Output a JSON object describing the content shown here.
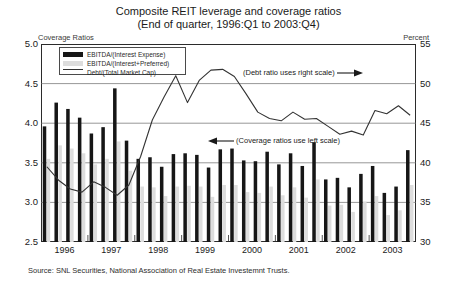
{
  "chart_data": {
    "type": "bar",
    "title": "Composite REIT leverage and coverage ratios",
    "subtitle": "(End of quarter, 1996:Q1 to 2003:Q4)",
    "left_axis_label": "Coverage Ratios",
    "right_axis_label": "Percent",
    "xlabel": "",
    "ylabel": "Coverage Ratios",
    "ylim": [
      2.5,
      5.0
    ],
    "y2lim": [
      30,
      55
    ],
    "yticks": [
      "2.5",
      "3.0",
      "3.5",
      "4.0",
      "4.5",
      "5.0"
    ],
    "y2ticks": [
      "30",
      "35",
      "40",
      "45",
      "50",
      "55"
    ],
    "grid": true,
    "legend_position": "top-left-inside",
    "categories": [
      "1996:Q1",
      "1996:Q2",
      "1996:Q3",
      "1996:Q4",
      "1997:Q1",
      "1997:Q2",
      "1997:Q3",
      "1997:Q4",
      "1998:Q1",
      "1998:Q2",
      "1998:Q3",
      "1998:Q4",
      "1999:Q1",
      "1999:Q2",
      "1999:Q3",
      "1999:Q4",
      "2000:Q1",
      "2000:Q2",
      "2000:Q3",
      "2000:Q4",
      "2001:Q1",
      "2001:Q2",
      "2001:Q3",
      "2001:Q4",
      "2002:Q1",
      "2002:Q2",
      "2002:Q3",
      "2002:Q4",
      "2003:Q1",
      "2003:Q2",
      "2003:Q3",
      "2003:Q4"
    ],
    "xtick_labels": [
      "1996",
      "1997",
      "1998",
      "1999",
      "2000",
      "2001",
      "2002",
      "2003"
    ],
    "series": [
      {
        "name": "EBITDA/(Interest Expense)",
        "axis": "left",
        "color": "#161616",
        "type": "bar",
        "values": [
          3.96,
          4.26,
          4.18,
          4.07,
          3.87,
          3.95,
          4.44,
          3.78,
          3.55,
          3.57,
          3.45,
          3.61,
          3.62,
          3.6,
          3.44,
          3.67,
          3.68,
          3.53,
          3.52,
          3.64,
          3.48,
          3.62,
          3.46,
          3.76,
          3.29,
          3.31,
          3.19,
          3.36,
          3.46,
          3.12,
          3.2,
          3.66
        ]
      },
      {
        "name": "EBITDA/(Interest+Preferred)",
        "axis": "left",
        "color": "#dddddd",
        "type": "bar",
        "values": [
          3.55,
          3.72,
          3.68,
          3.62,
          3.48,
          3.55,
          3.77,
          3.4,
          3.2,
          3.19,
          3.08,
          3.2,
          3.21,
          3.2,
          3.07,
          3.22,
          3.22,
          3.13,
          3.12,
          3.2,
          3.09,
          3.19,
          3.06,
          3.29,
          2.96,
          2.97,
          2.88,
          3.01,
          3.08,
          2.84,
          2.9,
          3.22
        ]
      },
      {
        "name": "Debt/(Total Market Cap)",
        "axis": "right",
        "color": "#333333",
        "type": "line",
        "values": [
          39.5,
          37.8,
          36.7,
          36.3,
          37.6,
          36.9,
          35.9,
          37.2,
          40.8,
          45.4,
          48.3,
          51.0,
          47.6,
          50.4,
          51.7,
          51.8,
          50.9,
          48.7,
          46.4,
          45.6,
          45.3,
          46.4,
          45.5,
          45.6,
          44.6,
          43.6,
          44.0,
          43.5,
          46.6,
          46.2,
          47.2,
          46.0
        ]
      }
    ],
    "annotations": [
      {
        "text": "(Debt ratio uses right scale)",
        "arrow": "right"
      },
      {
        "text": "(Coverage ratios use left scale)",
        "arrow": "left"
      }
    ],
    "source": "Source: SNL Securities, National Association of Real Estate Investemnt Trusts."
  }
}
